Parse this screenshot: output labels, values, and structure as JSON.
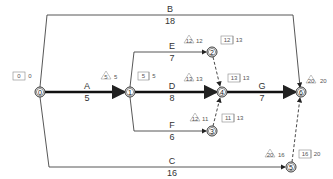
{
  "diagram": {
    "type": "activity-on-arrow network",
    "nodes": [
      {
        "id": "0",
        "label": "0",
        "x": 40,
        "y": 92
      },
      {
        "id": "1",
        "label": "1",
        "x": 130,
        "y": 92
      },
      {
        "id": "2",
        "label": "2",
        "x": 212,
        "y": 52
      },
      {
        "id": "3",
        "label": "3",
        "x": 212,
        "y": 131
      },
      {
        "id": "4",
        "label": "4",
        "x": 222,
        "y": 92
      },
      {
        "id": "5",
        "label": "5",
        "x": 291,
        "y": 167
      },
      {
        "id": "6",
        "label": "6",
        "x": 301,
        "y": 92
      }
    ],
    "activities": [
      {
        "name": "A",
        "duration": "5",
        "from": "0",
        "to": "1",
        "critical": true
      },
      {
        "name": "B",
        "duration": "18",
        "from": "0",
        "to": "6",
        "critical": false
      },
      {
        "name": "C",
        "duration": "16",
        "from": "0",
        "to": "5",
        "critical": false
      },
      {
        "name": "D",
        "duration": "8",
        "from": "1",
        "to": "4",
        "critical": true
      },
      {
        "name": "E",
        "duration": "7",
        "from": "1",
        "to": "2",
        "critical": false
      },
      {
        "name": "F",
        "duration": "6",
        "from": "1",
        "to": "3",
        "critical": false
      },
      {
        "name": "G",
        "duration": "7",
        "from": "4",
        "to": "6",
        "critical": true
      }
    ],
    "dummies": [
      {
        "from": "2",
        "to": "4"
      },
      {
        "from": "3",
        "to": "4"
      },
      {
        "from": "5",
        "to": "6"
      }
    ],
    "event_times": {
      "node0": {
        "box": [
          "0",
          "0"
        ]
      },
      "node1": {
        "tri": "5",
        "tri_extra": "5",
        "box": [
          "5",
          "5"
        ]
      },
      "node2": {
        "tri": "12",
        "tri_extra": "12",
        "box": [
          "12",
          "13"
        ]
      },
      "node3": {
        "tri": "12",
        "tri_extra": "11",
        "box": [
          "11",
          "13"
        ]
      },
      "node4": {
        "tri": "13",
        "tri_extra": "13",
        "box": [
          "13",
          "13"
        ]
      },
      "node5": {
        "tri": "20",
        "tri_extra": "16",
        "box": [
          "16",
          "20"
        ]
      },
      "node6": {
        "tri": "20",
        "tri_extra": "20"
      }
    }
  }
}
